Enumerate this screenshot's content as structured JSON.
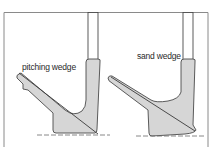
{
  "diagram": {
    "colors": {
      "outline": "#4a4a4a",
      "fill": "#d6d6d6",
      "frame": "#8a8a8a",
      "ground": "#6a6a6a"
    },
    "clubs": [
      {
        "label": "pitching wedge"
      },
      {
        "label": "sand wedge"
      }
    ]
  }
}
